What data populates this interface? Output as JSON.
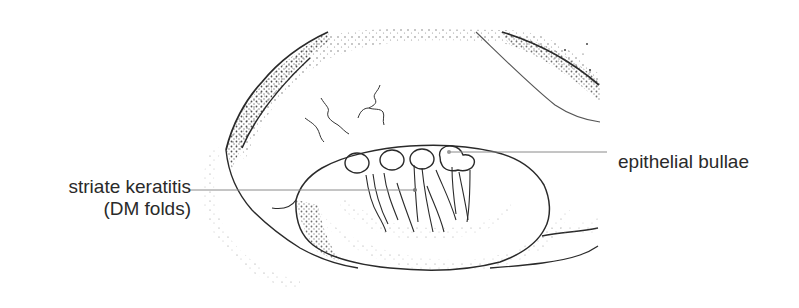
{
  "figure": {
    "stroke_color": "#2a2a2a",
    "leader_color": "#8a8a8a",
    "background": "#ffffff"
  },
  "labels": {
    "striate_keratitis": {
      "line1": "striate keratitis",
      "line2": "(DM folds)"
    },
    "epithelial_bullae": {
      "text": "epithelial bullae"
    }
  }
}
